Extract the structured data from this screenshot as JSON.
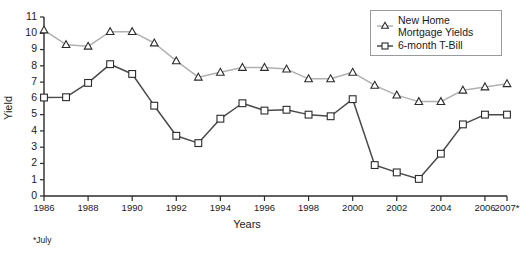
{
  "chart_data": {
    "type": "line",
    "title": "",
    "xlabel": "Years",
    "ylabel": "Yield",
    "ylim": [
      0,
      11
    ],
    "ytick_step": 1,
    "grid": false,
    "legend_position": "top-right",
    "footnote": "*July",
    "x": [
      "1986",
      "1987",
      "1988",
      "1989",
      "1990",
      "1991",
      "1992",
      "1993",
      "1994",
      "1995",
      "1996",
      "1997",
      "1998",
      "1999",
      "2000",
      "2001",
      "2002",
      "2003",
      "2004",
      "2005",
      "2006",
      "2007*"
    ],
    "xtick_labels": [
      "1986",
      "1988",
      "1990",
      "1992",
      "1994",
      "1996",
      "1998",
      "2000",
      "2002",
      "2004",
      "2006",
      "2007*"
    ],
    "ytick_labels": [
      "0",
      "1",
      "2",
      "3",
      "4",
      "5",
      "6",
      "7",
      "8",
      "9",
      "10",
      "11"
    ],
    "series": [
      {
        "name": "New Home Mortgage Yields",
        "marker": "triangle",
        "color": "#b0b0b0",
        "values": [
          10.2,
          9.3,
          9.2,
          10.1,
          10.1,
          9.4,
          8.3,
          7.3,
          7.6,
          7.9,
          7.9,
          7.8,
          7.2,
          7.2,
          7.6,
          6.8,
          6.2,
          5.8,
          5.8,
          6.5,
          6.7,
          6.9
        ]
      },
      {
        "name": "6-month T-Bill",
        "marker": "square",
        "color": "#4a4a4a",
        "values": [
          6.05,
          6.07,
          6.95,
          8.1,
          7.5,
          5.55,
          3.7,
          3.25,
          4.75,
          5.7,
          5.25,
          5.3,
          5.0,
          4.9,
          5.95,
          1.9,
          1.45,
          1.05,
          2.6,
          4.4,
          5.0,
          5.0
        ]
      }
    ]
  },
  "legend": {
    "entries": [
      {
        "label_line1": "New Home",
        "label_line2": "Mortgage Yields",
        "marker": "triangle"
      },
      {
        "label_line1": "6-month T-Bill",
        "label_line2": "",
        "marker": "square"
      }
    ]
  },
  "colors": {
    "mortgage_line": "#b0b0b0",
    "tbill_line": "#4a4a4a",
    "axis": "#2b2b2b",
    "marker_fill": "#ffffff",
    "marker_stroke": "#2b2b2b",
    "background": "#ffffff"
  }
}
